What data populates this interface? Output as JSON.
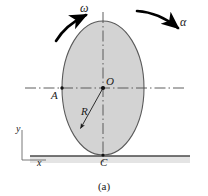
{
  "figure": {
    "caption": "(a)",
    "colors": {
      "disk_fill": "#d3d3d3",
      "disk_stroke": "#555555",
      "centerline": "#4d4d4d",
      "arrow": "#000000",
      "ground_line": "#4a4a4a",
      "ground_band": "#e2e2e2",
      "text": "#1a1a1a",
      "background": "#ffffff"
    },
    "labels": {
      "omega": "ω",
      "alpha": "α",
      "center": "O",
      "point_a": "A",
      "radius": "R",
      "contact_point": "C",
      "axis_y": "y",
      "axis_x": "x"
    },
    "geometry": {
      "center_x": 103,
      "center_y": 88,
      "radius_x": 41,
      "radius_y": 67,
      "point_a_x": 62,
      "point_a_y": 88,
      "contact_x": 103,
      "contact_y": 155,
      "radius_arrow_tip_x": 78,
      "radius_arrow_tip_y": 131,
      "ground_y": 156,
      "axis_origin_x": 22,
      "axis_origin_y": 160
    }
  }
}
